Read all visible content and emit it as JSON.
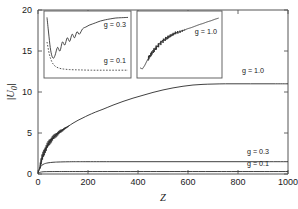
{
  "figure": {
    "background": "#ffffff",
    "line_color": "#2b2b2b",
    "frame_color": "#555555"
  },
  "chart_data": {
    "type": "line",
    "title": "",
    "xlabel": "Z",
    "ylabel": "|U0|",
    "ylabel_parts": {
      "base": "U",
      "sub": "0"
    },
    "xlim": [
      0,
      1000
    ],
    "ylim": [
      0,
      20
    ],
    "xticks": [
      0,
      200,
      400,
      600,
      800,
      1000
    ],
    "yticks": [
      0,
      5,
      10,
      15,
      20
    ],
    "xticklabels": [
      "0",
      "200",
      "400",
      "600",
      "800",
      "1000"
    ],
    "yticklabels": [
      "0",
      "5",
      "10",
      "15",
      "20"
    ],
    "grid": false,
    "legend_position": "inline-right",
    "annotations": [
      {
        "text": "g = 1.0",
        "x": 860,
        "y": 12.3
      },
      {
        "text": "g = 0.3",
        "x": 880,
        "y": 2.45
      },
      {
        "text": "g = 0.1",
        "x": 880,
        "y": 0.95
      }
    ],
    "series": [
      {
        "name": "g = 1.0",
        "style": "solid",
        "plateau": 11.0,
        "x": [
          0,
          5,
          10,
          15,
          20,
          25,
          30,
          35,
          40,
          45,
          50,
          60,
          70,
          80,
          90,
          100,
          110,
          120,
          140,
          160,
          180,
          200,
          230,
          260,
          300,
          340,
          380,
          420,
          460,
          500,
          540,
          580,
          620,
          660,
          700,
          750,
          800,
          850,
          900,
          950,
          1000
        ],
        "y": [
          0.2,
          0.6,
          1.2,
          1.8,
          2.3,
          2.7,
          3.0,
          3.3,
          3.6,
          3.85,
          4.05,
          4.4,
          4.7,
          4.95,
          5.2,
          5.4,
          5.6,
          5.8,
          6.2,
          6.55,
          6.85,
          7.15,
          7.55,
          7.9,
          8.4,
          8.85,
          9.25,
          9.6,
          9.95,
          10.25,
          10.5,
          10.7,
          10.85,
          10.93,
          10.97,
          11.0,
          11.0,
          11.0,
          11.0,
          11.0,
          11.0
        ],
        "oscillation": {
          "range_x": [
            8,
            125
          ],
          "amplitude": 0.55,
          "frequency": 0.9
        }
      },
      {
        "name": "g = 0.3",
        "style": "solid",
        "plateau": 1.5,
        "x": [
          0,
          4,
          8,
          12,
          16,
          20,
          25,
          30,
          40,
          50,
          60,
          70,
          80,
          100,
          120,
          150,
          200,
          300,
          400,
          500,
          600,
          700,
          800,
          900,
          1000
        ],
        "y": [
          0.1,
          0.45,
          0.75,
          0.95,
          1.08,
          1.16,
          1.24,
          1.29,
          1.36,
          1.4,
          1.43,
          1.45,
          1.46,
          1.48,
          1.49,
          1.5,
          1.5,
          1.5,
          1.5,
          1.5,
          1.5,
          1.5,
          1.5,
          1.5,
          1.5
        ]
      },
      {
        "name": "g = 0.1",
        "style": "solid",
        "plateau": 0.3,
        "x": [
          0,
          5,
          10,
          20,
          40,
          80,
          150,
          300,
          500,
          700,
          1000
        ],
        "y": [
          0.05,
          0.16,
          0.22,
          0.27,
          0.29,
          0.3,
          0.3,
          0.3,
          0.3,
          0.3,
          0.3
        ]
      }
    ],
    "insets": [
      {
        "id": "inset-left",
        "annotations": [
          {
            "text": "g = 0.3",
            "position": "upper-right"
          },
          {
            "text": "g = 0.1",
            "position": "lower-right"
          }
        ],
        "series": [
          {
            "name": "g = 0.3",
            "style": "solid",
            "x": [
              0,
              2,
              4,
              6,
              8,
              10,
              13,
              16,
              19,
              22,
              25,
              28,
              31,
              34,
              37,
              40,
              44,
              48,
              52,
              56,
              60,
              66,
              72,
              78,
              85,
              92,
              100
            ],
            "y": [
              0.96,
              0.7,
              0.46,
              0.32,
              0.28,
              0.33,
              0.46,
              0.4,
              0.55,
              0.5,
              0.62,
              0.56,
              0.68,
              0.62,
              0.72,
              0.68,
              0.77,
              0.8,
              0.83,
              0.85,
              0.87,
              0.9,
              0.92,
              0.935,
              0.95,
              0.955,
              0.96
            ]
          },
          {
            "name": "g = 0.1",
            "style": "dashed",
            "x": [
              0,
              3,
              6,
              9,
              12,
              16,
              20,
              28,
              40,
              55,
              70,
              85,
              100
            ],
            "y": [
              0.55,
              0.34,
              0.22,
              0.16,
              0.13,
              0.11,
              0.1,
              0.09,
              0.085,
              0.08,
              0.08,
              0.08,
              0.08
            ]
          }
        ]
      },
      {
        "id": "inset-right",
        "annotations": [
          {
            "text": "g = 1.0",
            "position": "mid-right"
          }
        ],
        "series": [
          {
            "name": "g = 1.0",
            "style": "solid",
            "x": [
              0,
              3,
              6,
              9,
              12,
              16,
              20,
              24,
              28,
              32,
              36,
              40,
              45,
              50,
              55,
              60,
              65,
              70,
              75,
              80,
              85,
              90,
              95,
              100
            ],
            "y": [
              0.12,
              0.1,
              0.16,
              0.24,
              0.3,
              0.38,
              0.45,
              0.51,
              0.56,
              0.6,
              0.63,
              0.66,
              0.7,
              0.72,
              0.745,
              0.77,
              0.79,
              0.815,
              0.84,
              0.86,
              0.885,
              0.905,
              0.93,
              0.95
            ],
            "oscillation": {
              "range_x": [
                10,
                58
              ],
              "amplitude": 0.05,
              "frequency": 2.2
            }
          }
        ]
      }
    ]
  }
}
